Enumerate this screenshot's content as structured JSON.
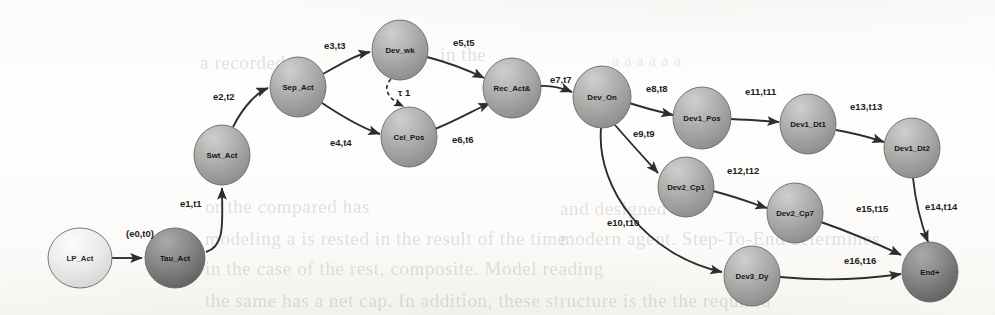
{
  "figure": {
    "type": "directed-graph",
    "background_color": "#fdfdfc",
    "edge_color": "#2e2e2e"
  },
  "nodes": [
    {
      "id": "lp_act",
      "label": "LP_Act",
      "cx": 80,
      "cy": 258,
      "rx": 32,
      "ry": 30,
      "shade": "light"
    },
    {
      "id": "tau_act",
      "label": "Tau_Act",
      "cx": 175,
      "cy": 258,
      "rx": 30,
      "ry": 30,
      "shade": "dark"
    },
    {
      "id": "swt_act",
      "label": "Swt_Act",
      "cx": 222,
      "cy": 155,
      "rx": 28,
      "ry": 30,
      "shade": "mid"
    },
    {
      "id": "sep_act",
      "label": "Sep_Act",
      "cx": 298,
      "cy": 87,
      "rx": 28,
      "ry": 30,
      "shade": "mid"
    },
    {
      "id": "dev_wk",
      "label": "Dev_wk",
      "cx": 400,
      "cy": 50,
      "rx": 28,
      "ry": 30,
      "shade": "mid"
    },
    {
      "id": "cel_pos",
      "label": "Cel_Pos",
      "cx": 409,
      "cy": 137,
      "rx": 28,
      "ry": 30,
      "shade": "mid"
    },
    {
      "id": "rec_act",
      "label": "Rec_Act&",
      "cx": 512,
      "cy": 88,
      "rx": 29,
      "ry": 30,
      "shade": "mid"
    },
    {
      "id": "dev_on",
      "label": "Dev_On",
      "cx": 602,
      "cy": 97,
      "rx": 29,
      "ry": 31,
      "shade": "mid"
    },
    {
      "id": "dev1_pos",
      "label": "Dev1_Pos",
      "cx": 702,
      "cy": 118,
      "rx": 29,
      "ry": 31,
      "shade": "mid"
    },
    {
      "id": "dev1_dt1",
      "label": "Dev1_Dt1",
      "cx": 808,
      "cy": 124,
      "rx": 28,
      "ry": 30,
      "shade": "mid"
    },
    {
      "id": "dev1_dt2",
      "label": "Dev1_Dt2",
      "cx": 912,
      "cy": 148,
      "rx": 28,
      "ry": 30,
      "shade": "mid"
    },
    {
      "id": "dev2_cp1",
      "label": "Dev2_Cp1",
      "cx": 686,
      "cy": 187,
      "rx": 28,
      "ry": 30,
      "shade": "mid"
    },
    {
      "id": "dev2_cp7",
      "label": "Dev2_Cp7",
      "cx": 795,
      "cy": 213,
      "rx": 28,
      "ry": 30,
      "shade": "mid"
    },
    {
      "id": "dev3_dy",
      "label": "Dev3_Dy",
      "cx": 752,
      "cy": 276,
      "rx": 28,
      "ry": 30,
      "shade": "mid"
    },
    {
      "id": "end_plus",
      "label": "End+",
      "cx": 930,
      "cy": 272,
      "rx": 28,
      "ry": 30,
      "shade": "dark"
    }
  ],
  "edges": [
    {
      "id": "e0",
      "label": "(e0,t0)",
      "from": "lp_act",
      "to": "tau_act",
      "label_x": 126,
      "label_y": 237,
      "path": "M 112 258 L 142 258",
      "dashed": false
    },
    {
      "id": "e1",
      "label": "e1,t1",
      "from": "tau_act",
      "to": "swt_act",
      "label_x": 180,
      "label_y": 207,
      "path": "M 206 252 C 226 246 222 220 222 188",
      "dashed": false
    },
    {
      "id": "e2",
      "label": "e2,t2",
      "from": "swt_act",
      "to": "sep_act",
      "label_x": 213,
      "label_y": 100,
      "path": "M 233 127 C 244 105 258 92 268 88",
      "dashed": false
    },
    {
      "id": "e3",
      "label": "e3,t3",
      "from": "sep_act",
      "to": "dev_wk",
      "label_x": 324,
      "label_y": 49,
      "path": "M 323 74 C 344 62 356 55 370 52",
      "dashed": false
    },
    {
      "id": "e4",
      "label": "e4,t4",
      "from": "sep_act",
      "to": "cel_pos",
      "label_x": 330,
      "label_y": 146,
      "path": "M 322 103 C 346 119 362 128 380 134",
      "dashed": false
    },
    {
      "id": "tau1",
      "label": "τ 1",
      "from": "dev_wk",
      "to": "cel_pos",
      "label_x": 398,
      "label_y": 96,
      "path": "M 391 79 C 382 88 388 99 403 106",
      "dashed": true
    },
    {
      "id": "e5",
      "label": "e5,t5",
      "from": "dev_wk",
      "to": "rec_act",
      "label_x": 453,
      "label_y": 46,
      "path": "M 427 57 C 454 64 470 71 484 78",
      "dashed": false
    },
    {
      "id": "e6",
      "label": "e6,t6",
      "from": "cel_pos",
      "to": "rec_act",
      "label_x": 452,
      "label_y": 143,
      "path": "M 435 129 C 458 120 474 110 490 103",
      "dashed": false
    },
    {
      "id": "e7",
      "label": "e7,t7",
      "from": "rec_act",
      "to": "dev_on",
      "label_x": 550,
      "label_y": 83,
      "path": "M 540 86 C 552 85 562 88 572 92",
      "dashed": false
    },
    {
      "id": "e8",
      "label": "e8,t8",
      "from": "dev_on",
      "to": "dev1_pos",
      "label_x": 646,
      "label_y": 92,
      "path": "M 629 103 C 648 109 660 112 673 115",
      "dashed": false
    },
    {
      "id": "e9",
      "label": "e9,t9",
      "from": "dev_on",
      "to": "dev2_cp1",
      "label_x": 633,
      "label_y": 137,
      "path": "M 615 125 C 635 148 648 162 658 173",
      "dashed": false
    },
    {
      "id": "e10",
      "label": "e10,t10",
      "from": "dev_on",
      "to": "dev3_dy",
      "label_x": 607,
      "label_y": 226,
      "path": "M 601 128 C 596 190 648 256 722 272",
      "dashed": false
    },
    {
      "id": "e11",
      "label": "e11,t11",
      "from": "dev1_pos",
      "to": "dev1_dt1",
      "label_x": 745,
      "label_y": 95,
      "path": "M 731 119 C 752 120 765 121 779 122",
      "dashed": false
    },
    {
      "id": "e12",
      "label": "e12,t12",
      "from": "dev2_cp1",
      "to": "dev2_cp7",
      "label_x": 727,
      "label_y": 174,
      "path": "M 713 191 C 740 198 754 204 767 208",
      "dashed": false
    },
    {
      "id": "e13",
      "label": "e13,t13",
      "from": "dev1_dt1",
      "to": "dev1_dt2",
      "label_x": 850,
      "label_y": 110,
      "path": "M 836 130 C 859 134 872 138 884 142",
      "dashed": false
    },
    {
      "id": "e14",
      "label": "e14,t14",
      "from": "dev1_dt2",
      "to": "end_plus",
      "label_x": 925,
      "label_y": 210,
      "path": "M 913 178 C 916 206 922 226 928 242",
      "dashed": false
    },
    {
      "id": "e15",
      "label": "e15,t15",
      "from": "dev2_cp7",
      "to": "end_plus",
      "label_x": 856,
      "label_y": 212,
      "path": "M 821 222 C 861 236 882 246 901 255",
      "dashed": false
    },
    {
      "id": "e16",
      "label": "e16,t16",
      "from": "dev3_dy",
      "to": "end_plus",
      "label_x": 844,
      "label_y": 264,
      "path": "M 780 277 C 832 282 874 278 901 274",
      "dashed": false
    }
  ],
  "background_text": [
    {
      "text": "a recorded",
      "x": 200,
      "y": 52,
      "size": 19
    },
    {
      "text": "in the",
      "x": 440,
      "y": 44,
      "size": 19
    },
    {
      "text": "a a a a a a",
      "x": 612,
      "y": 52,
      "size": 16
    },
    {
      "text": "or the compared has",
      "x": 205,
      "y": 196,
      "size": 19
    },
    {
      "text": "and designed for",
      "x": 560,
      "y": 198,
      "size": 19
    },
    {
      "text": "modeling a is rested in the result of the time",
      "x": 205,
      "y": 228,
      "size": 19
    },
    {
      "text": "modern agent. Step-To-End determines",
      "x": 560,
      "y": 228,
      "size": 19
    },
    {
      "text": "in the case of the rest, composite. Model reading",
      "x": 205,
      "y": 258,
      "size": 19
    },
    {
      "text": "the same has a net cap. In addition, these structure is the the required",
      "x": 205,
      "y": 290,
      "size": 19
    }
  ]
}
